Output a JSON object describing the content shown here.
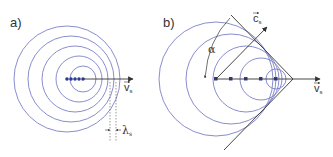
{
  "colors": {
    "wave": "#7a80c8",
    "dot": "#2e3a8c",
    "axis": "#333333",
    "line": "#333333"
  },
  "panel_a": {
    "label": "a)",
    "velocity_label": "v",
    "velocity_sub": "s",
    "wavelength_label": "λ",
    "wavelength_sub": "s"
  },
  "panel_b": {
    "label": "b)",
    "velocity_label": "v",
    "velocity_sub": "s",
    "sound_label": "c",
    "sound_sub": "s",
    "angle_label": "α"
  }
}
